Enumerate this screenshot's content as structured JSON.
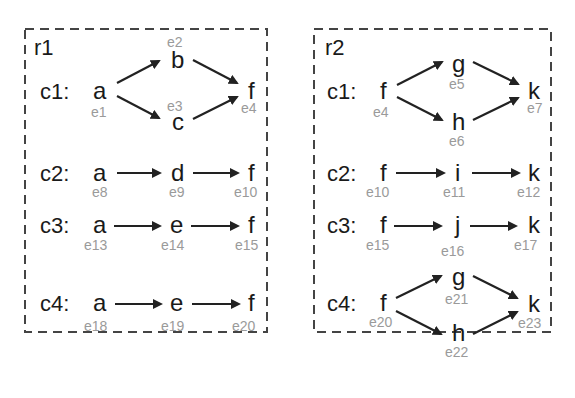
{
  "regions": [
    {
      "label": "r1",
      "rows": [
        {
          "label": "c1:",
          "nodes": [
            {
              "text": "a",
              "id": "e1"
            },
            {
              "text": "b",
              "id": "e2"
            },
            {
              "text": "c",
              "id": "e3"
            },
            {
              "text": "f",
              "id": "e4"
            }
          ],
          "edges": [
            [
              "a",
              "b"
            ],
            [
              "a",
              "c"
            ],
            [
              "b",
              "f"
            ],
            [
              "c",
              "f"
            ]
          ]
        },
        {
          "label": "c2:",
          "nodes": [
            {
              "text": "a",
              "id": "e8"
            },
            {
              "text": "d",
              "id": "e9"
            },
            {
              "text": "f",
              "id": "e10"
            }
          ],
          "edges": [
            [
              "a",
              "d"
            ],
            [
              "d",
              "f"
            ]
          ]
        },
        {
          "label": "c3:",
          "nodes": [
            {
              "text": "a",
              "id": "e13"
            },
            {
              "text": "e",
              "id": "e14"
            },
            {
              "text": "f",
              "id": "e15"
            }
          ],
          "edges": [
            [
              "a",
              "e"
            ],
            [
              "e",
              "f"
            ]
          ]
        },
        {
          "label": "c4:",
          "nodes": [
            {
              "text": "a",
              "id": "e18"
            },
            {
              "text": "e",
              "id": "e19"
            },
            {
              "text": "f",
              "id": "e20"
            }
          ],
          "edges": [
            [
              "a",
              "e"
            ],
            [
              "e",
              "f"
            ]
          ]
        }
      ]
    },
    {
      "label": "r2",
      "rows": [
        {
          "label": "c1:",
          "nodes": [
            {
              "text": "f",
              "id": "e4"
            },
            {
              "text": "g",
              "id": "e5"
            },
            {
              "text": "h",
              "id": "e6"
            },
            {
              "text": "k",
              "id": "e7"
            }
          ],
          "edges": [
            [
              "f",
              "g"
            ],
            [
              "f",
              "h"
            ],
            [
              "g",
              "k"
            ],
            [
              "h",
              "k"
            ]
          ]
        },
        {
          "label": "c2:",
          "nodes": [
            {
              "text": "f",
              "id": "e10"
            },
            {
              "text": "i",
              "id": "e11"
            },
            {
              "text": "k",
              "id": "e12"
            }
          ],
          "edges": [
            [
              "f",
              "i"
            ],
            [
              "i",
              "k"
            ]
          ]
        },
        {
          "label": "c3:",
          "nodes": [
            {
              "text": "f",
              "id": "e15"
            },
            {
              "text": "j",
              "id": "e16"
            },
            {
              "text": "k",
              "id": "e17"
            }
          ],
          "edges": [
            [
              "f",
              "j"
            ],
            [
              "j",
              "k"
            ]
          ]
        },
        {
          "label": "c4:",
          "nodes": [
            {
              "text": "f",
              "id": "e20"
            },
            {
              "text": "g",
              "id": "e21"
            },
            {
              "text": "h",
              "id": "e22"
            },
            {
              "text": "k",
              "id": "e23"
            }
          ],
          "edges": [
            [
              "f",
              "g"
            ],
            [
              "f",
              "h"
            ],
            [
              "g",
              "k"
            ],
            [
              "h",
              "k"
            ]
          ]
        }
      ]
    }
  ]
}
